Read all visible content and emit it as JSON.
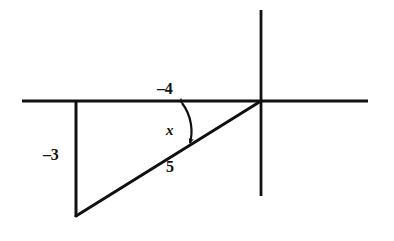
{
  "figure": {
    "background_color": "#ffffff",
    "stroke_color": "#111111",
    "labels": {
      "adjacent_leg": "–4",
      "opposite_leg": "–3",
      "hypotenuse": "5",
      "angle": "x"
    },
    "icons": {
      "angle_arc": "double-arrow-arc-icon",
      "x_axis": "horizontal-axis-icon",
      "y_axis": "vertical-axis-icon"
    },
    "geometry": {
      "origin": [
        261,
        101
      ],
      "x_axis": [
        22,
        101,
        368,
        101
      ],
      "y_axis": [
        261,
        10,
        261,
        196
      ],
      "vertical_leg": [
        76,
        101,
        76,
        216
      ],
      "horizontal_leg": [
        76,
        101,
        261,
        101
      ],
      "hypotenuse": [
        76,
        216,
        261,
        101
      ],
      "arc_start": [
        182,
        102
      ],
      "arc_end": [
        191,
        144
      ]
    }
  }
}
